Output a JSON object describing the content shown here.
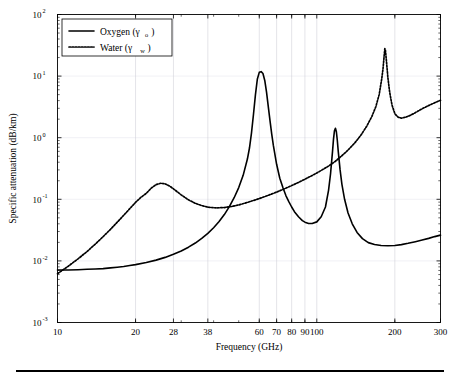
{
  "figure": {
    "background": "#ffffff",
    "frame_color": "#000000",
    "grid_color": "#c9c9d2"
  },
  "chart_data": {
    "type": "line",
    "title": "",
    "xlabel": "Frequency (GHz)",
    "ylabel": "Specific attenuation (dB/km)",
    "xscale": "log",
    "yscale": "log",
    "xlim": [
      10,
      300
    ],
    "ylim": [
      0.001,
      100
    ],
    "grid": true,
    "legend_position": "top-left",
    "xticks": [
      10,
      20,
      28,
      38,
      60,
      70,
      80,
      90,
      100,
      200,
      300
    ],
    "xtick_labels": [
      "10",
      "20",
      "28",
      "38",
      "60",
      "70",
      "80",
      "90",
      "100",
      "200",
      "300"
    ],
    "yticks": [
      0.001,
      0.01,
      0.1,
      1,
      10,
      100
    ],
    "ytick_labels": [
      "10-3",
      "10-2",
      "10-1",
      "100",
      "101",
      "102"
    ],
    "ytick_mantissa": "10",
    "ytick_exponents": [
      "-3",
      "-2",
      "-1",
      "0",
      "1",
      "2"
    ],
    "series": [
      {
        "name": "Oxygen",
        "symbol": "γ",
        "subscript": "o",
        "legend_label": "Oxygen (γ",
        "style": "solid",
        "color": "#000000",
        "x": [
          10,
          11,
          12,
          13,
          14,
          15,
          16,
          17,
          18,
          19,
          20,
          22,
          24,
          26,
          28,
          30,
          32,
          34,
          36,
          38,
          40,
          42,
          44,
          46,
          48,
          50,
          52,
          54,
          55,
          56,
          57,
          58,
          59,
          60,
          61,
          62,
          63,
          64,
          65,
          66,
          67,
          68,
          70,
          72,
          74,
          76,
          78,
          80,
          82,
          85,
          88,
          90,
          93,
          96,
          100,
          104,
          108,
          111,
          113,
          115,
          116,
          117,
          118,
          119,
          120,
          121,
          123,
          125,
          128,
          132,
          137,
          143,
          150,
          158,
          167,
          177,
          188,
          200,
          212,
          225,
          240,
          255,
          270,
          285,
          300
        ],
        "y": [
          0.0071,
          0.0071,
          0.0072,
          0.0073,
          0.0074,
          0.0075,
          0.0077,
          0.0079,
          0.0081,
          0.0084,
          0.0087,
          0.0094,
          0.0103,
          0.0114,
          0.0128,
          0.0145,
          0.0167,
          0.0195,
          0.0232,
          0.028,
          0.0345,
          0.0435,
          0.0565,
          0.076,
          0.106,
          0.155,
          0.245,
          0.45,
          0.68,
          1.2,
          2.4,
          5.0,
          9.0,
          11.5,
          11.8,
          11.0,
          8.5,
          5.5,
          3.2,
          1.9,
          1.15,
          0.75,
          0.37,
          0.22,
          0.155,
          0.115,
          0.092,
          0.075,
          0.063,
          0.052,
          0.045,
          0.0425,
          0.0405,
          0.0405,
          0.043,
          0.052,
          0.075,
          0.14,
          0.26,
          0.6,
          0.95,
          1.3,
          1.42,
          1.25,
          0.9,
          0.6,
          0.3,
          0.175,
          0.1,
          0.06,
          0.04,
          0.029,
          0.023,
          0.0198,
          0.0185,
          0.0178,
          0.0176,
          0.0178,
          0.0184,
          0.0193,
          0.0205,
          0.0218,
          0.0232,
          0.0248,
          0.0262
        ]
      },
      {
        "name": "Water",
        "symbol": "γ",
        "subscript": "w",
        "legend_label": "Water (γ",
        "style": "dotted",
        "color": "#000000",
        "x": [
          10,
          11,
          12,
          13,
          14,
          15,
          16,
          17,
          18,
          19,
          20,
          21,
          22,
          23,
          24,
          25,
          26,
          27,
          28,
          30,
          32,
          34,
          36,
          38,
          41,
          44,
          47,
          50,
          54,
          58,
          62,
          66,
          70,
          75,
          80,
          85,
          90,
          95,
          100,
          106,
          112,
          118,
          125,
          132,
          140,
          148,
          156,
          163,
          169,
          174,
          178,
          180,
          182,
          183,
          184,
          186,
          188,
          191,
          195,
          200,
          206,
          212,
          220,
          228,
          236,
          245,
          255,
          265,
          275,
          285,
          300
        ],
        "y": [
          0.0062,
          0.0082,
          0.0108,
          0.0142,
          0.0188,
          0.0248,
          0.0325,
          0.0425,
          0.055,
          0.0705,
          0.089,
          0.108,
          0.125,
          0.152,
          0.173,
          0.182,
          0.178,
          0.165,
          0.148,
          0.118,
          0.098,
          0.086,
          0.079,
          0.0745,
          0.0725,
          0.0735,
          0.0765,
          0.081,
          0.089,
          0.098,
          0.108,
          0.119,
          0.131,
          0.148,
          0.167,
          0.188,
          0.212,
          0.238,
          0.268,
          0.308,
          0.355,
          0.415,
          0.51,
          0.63,
          0.82,
          1.1,
          1.55,
          2.2,
          3.2,
          5.0,
          9.0,
          13.0,
          22.0,
          28.0,
          26.0,
          16.0,
          9.5,
          5.5,
          3.4,
          2.45,
          2.15,
          2.08,
          2.15,
          2.28,
          2.45,
          2.68,
          2.95,
          3.2,
          3.45,
          3.7,
          4.05
        ]
      }
    ],
    "annotations": {
      "oxygen_peak_60ghz": 11.8,
      "oxygen_peak_118ghz": 1.42,
      "water_peak_22ghz": 0.182,
      "water_peak_183ghz": 28.0
    }
  }
}
